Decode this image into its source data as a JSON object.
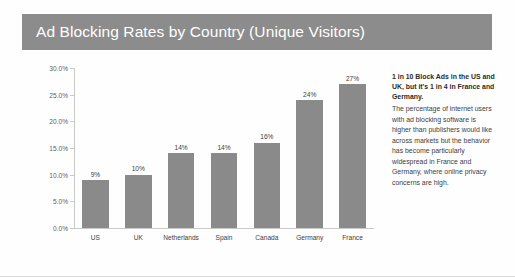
{
  "header": {
    "title": "Ad Blocking Rates by Country (Unique Visitors)",
    "band_color": "#8c8c8c",
    "title_color": "#ffffff"
  },
  "annotation": {
    "headline": "1 in 10 Block Ads in the US and UK, but it's 1 in 4 in France and Germany.",
    "body": "The percentage of internet users with ad blocking software is higher than publishers would like across markets but the behavior has become particularly widespread in France and Germany, where online privacy concerns are high."
  },
  "chart_data": {
    "type": "bar",
    "title": "Ad Blocking Rates by Country (Unique Visitors)",
    "xlabel": "",
    "ylabel": "",
    "categories": [
      "US",
      "UK",
      "Netherlands",
      "Spain",
      "Canada",
      "Germany",
      "France"
    ],
    "values": [
      9,
      10,
      14,
      14,
      16,
      24,
      27
    ],
    "data_labels": [
      "9%",
      "10%",
      "14%",
      "14%",
      "16%",
      "24%",
      "27%"
    ],
    "ylim": [
      0,
      30
    ],
    "ytick_values": [
      0,
      5,
      10,
      15,
      20,
      25,
      30
    ],
    "ytick_labels": [
      "0.0%",
      "5.0%",
      "10.0%",
      "15.0%",
      "20.0%",
      "25.0%",
      "30.0%"
    ],
    "grid": false,
    "legend": false,
    "bar_color": "#8a8a8a",
    "axis_color": "#c9c9c9"
  }
}
